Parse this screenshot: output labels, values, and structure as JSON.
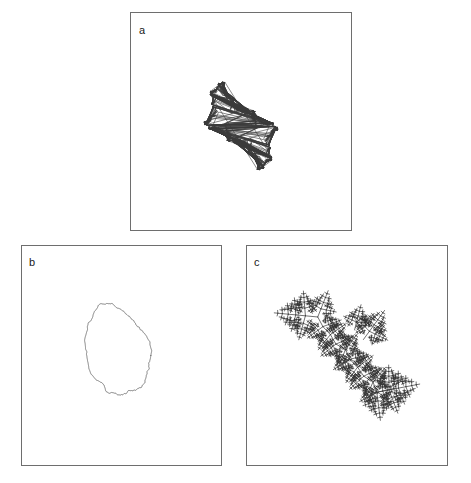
{
  "figure": {
    "background_color": "#ffffff",
    "frame_color": "#6e6e6e",
    "curve_color": "#3a3a3a",
    "width": 471,
    "height": 483
  },
  "panels": [
    {
      "id": "a",
      "label": "a",
      "description": "Julia set boundary with decorating bulbs, horizontally elongated",
      "x": 130,
      "y": 12,
      "width": 222,
      "height": 219,
      "ticks": {
        "bottom": 3,
        "top": 3,
        "left": 3,
        "right": 3
      }
    },
    {
      "id": "b",
      "label": "b",
      "description": "Rough closed blob-like fractal contour",
      "x": 21,
      "y": 245,
      "width": 201,
      "height": 221,
      "ticks": {
        "bottom": 3,
        "top": 3,
        "left": 3,
        "right": 3
      }
    },
    {
      "id": "c",
      "label": "c",
      "description": "Dendritic branching fractal along a diagonal",
      "x": 246,
      "y": 245,
      "width": 202,
      "height": 221,
      "ticks": {
        "bottom": 3,
        "top": 3,
        "left": 3,
        "right": 3
      }
    }
  ],
  "chart_data": {
    "type": "line",
    "title": "",
    "xlabel": "",
    "ylabel": "",
    "grid": false,
    "legend": null,
    "subplots": [
      {
        "panel": "a",
        "label": "a",
        "curve_type": "julia-set-boundary",
        "closed": true,
        "xlim": [
          -1,
          1
        ],
        "ylim": [
          -1,
          1
        ],
        "n_points": 4096,
        "tick_positions_x": [
          -0.5,
          0,
          0.5
        ],
        "tick_positions_y": [
          -0.5,
          0,
          0.5
        ],
        "extent": {
          "x": [
            -0.78,
            0.78
          ],
          "y": [
            -0.33,
            0.33
          ]
        }
      },
      {
        "panel": "b",
        "label": "b",
        "curve_type": "rough-closed-contour",
        "closed": true,
        "xlim": [
          -1,
          1
        ],
        "ylim": [
          -1,
          1
        ],
        "n_points": 2048,
        "tick_positions_x": [
          -0.5,
          0,
          0.5
        ],
        "tick_positions_y": [
          -0.5,
          0,
          0.5
        ],
        "extent": {
          "x": [
            -0.42,
            0.46
          ],
          "y": [
            -0.56,
            0.52
          ]
        }
      },
      {
        "panel": "c",
        "label": "c",
        "curve_type": "dendrite",
        "closed": false,
        "xlim": [
          -1,
          1
        ],
        "ylim": [
          -1,
          1
        ],
        "n_points": 3000,
        "tick_positions_x": [
          -0.5,
          0,
          0.5
        ],
        "tick_positions_y": [
          -0.5,
          0,
          0.5
        ],
        "extent": {
          "x": [
            -0.62,
            0.68
          ],
          "y": [
            -0.62,
            0.6
          ]
        }
      }
    ]
  }
}
